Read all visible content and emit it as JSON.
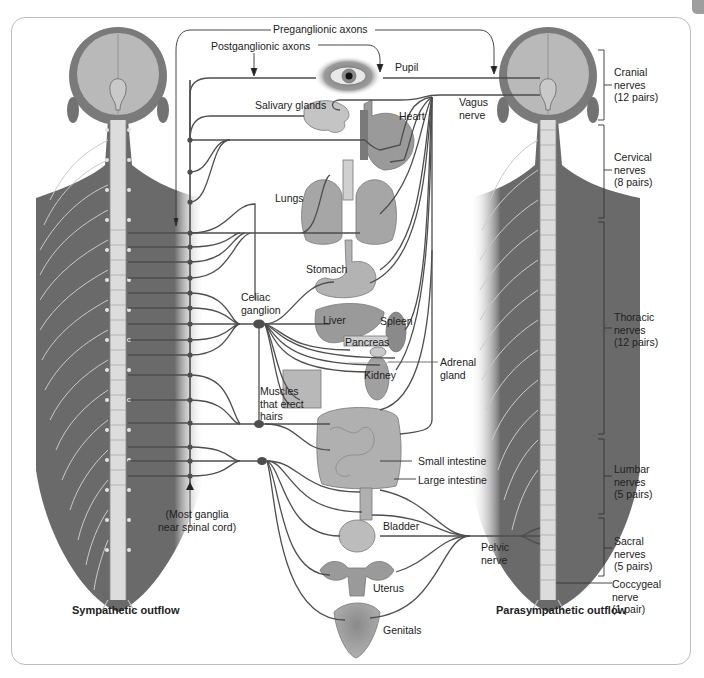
{
  "figure": {
    "title_left": "Sympathetic outflow",
    "title_right": "Parasympathetic outflow"
  },
  "axons": {
    "preganglionic": "Preganglionic axons",
    "postganglionic": "Postganglionic axons"
  },
  "organs": {
    "pupil": "Pupil",
    "salivary": "Salivary glands",
    "heart": "Heart",
    "vagus": "Vagus\nnerve",
    "lungs": "Lungs",
    "stomach": "Stomach",
    "celiac": "Celiac\nganglion",
    "liver": "Liver",
    "spleen": "Spleen",
    "pancreas": "Pancreas",
    "adrenal": "Adrenal\ngland",
    "kidney": "Kidney",
    "muscles": "Muscles\nthat erect\nhairs",
    "small_intestine": "Small intestine",
    "large_intestine": "Large intestine",
    "most_ganglia": "(Most ganglia\nnear spinal cord)",
    "bladder": "Bladder",
    "pelvic": "Pelvic\nnerve",
    "uterus": "Uterus",
    "genitals": "Genitals"
  },
  "spinal_regions": [
    {
      "name": "Cranial",
      "label": "Cranial\nnerves\n(12 pairs)"
    },
    {
      "name": "Cervical",
      "label": "Cervical\nnerves\n(8 pairs)"
    },
    {
      "name": "Thoracic",
      "label": "Thoracic\nnerves\n(12 pairs)"
    },
    {
      "name": "Lumbar",
      "label": "Lumbar\nnerves\n(5 pairs)"
    },
    {
      "name": "Sacral",
      "label": "Sacral\nnerves\n(5 pairs)"
    },
    {
      "name": "Coccygeal",
      "label": "Coccygeal\nnerve\n(1 pair)"
    }
  ],
  "colors": {
    "body": "#6d6d6d",
    "head_inner": "#b9b9b9",
    "spine": "#dcdcdc",
    "nerve": "#555555",
    "organ": "#a8a8a8",
    "frame": "#bdbdbd"
  }
}
